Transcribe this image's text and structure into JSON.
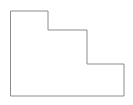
{
  "canvas": {
    "width": 133,
    "height": 105,
    "background_color": "#ffffff",
    "label": "step-polygon-figure"
  },
  "figure": {
    "name": "step-polygon",
    "stroke_color": "#8c8c8c",
    "fill_color": "#ffffff",
    "stroke_width": 1,
    "vertex_count": 8,
    "vertices": [
      {
        "x": 11,
        "y": 11
      },
      {
        "x": 48,
        "y": 11
      },
      {
        "x": 48,
        "y": 30
      },
      {
        "x": 87,
        "y": 30
      },
      {
        "x": 87,
        "y": 64
      },
      {
        "x": 124,
        "y": 64
      },
      {
        "x": 124,
        "y": 96
      },
      {
        "x": 11,
        "y": 96
      }
    ],
    "path_d": "M 11 11 L 48 11 L 48 30 L 87 30 L 87 64 L 124 64 L 124 96 L 11 96 Z"
  }
}
